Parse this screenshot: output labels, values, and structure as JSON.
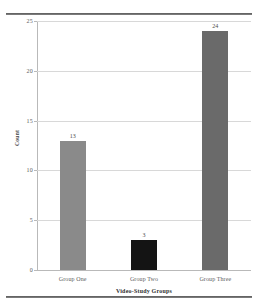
{
  "chart_data": {
    "type": "bar",
    "title": "",
    "subtitle": "",
    "xlabel": "Video-Study Groups",
    "ylabel": "Count",
    "categories": [
      "Group One",
      "Group Two",
      "Group Three"
    ],
    "values": [
      13,
      3,
      24
    ],
    "data_labels": [
      "13",
      "3",
      "24"
    ],
    "bar_colors": [
      "#8a8a8a",
      "#141414",
      "#6a6a6a"
    ],
    "ylim": [
      0,
      25
    ],
    "ytick_labels": [
      "0",
      "5",
      "10",
      "15",
      "20",
      "25"
    ],
    "ytick_values": [
      0,
      5,
      10,
      15,
      20,
      25
    ],
    "grid": true,
    "grid_axis": "y",
    "legend": false,
    "legend_position": "none",
    "series": [
      {
        "name": "Count",
        "values": [
          13,
          3,
          24
        ]
      }
    ]
  },
  "figure": {
    "background_color": "#ffffff",
    "axis_color": "#b9b9b9",
    "grid_color": "#d8d8d8",
    "rule_color": "#5a5a5a"
  }
}
